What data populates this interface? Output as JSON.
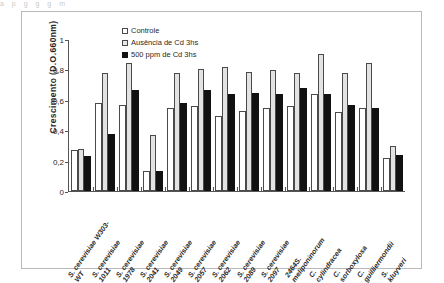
{
  "figure": {
    "ghost_text": "a      p          g  g                                                g            m",
    "background": "#ffffff",
    "frame_color": "#b9b9b9"
  },
  "axes": {
    "y_title": "Crescimento (D.O.660nm)",
    "y_ticks": [
      "0",
      "0,2",
      "0,4",
      "0,6",
      "0,8",
      "1"
    ],
    "y_min": 0,
    "y_max": 1,
    "x_title": ""
  },
  "legend": {
    "position": "top-left-inside",
    "items": [
      {
        "label": "Controle",
        "color": "#ffffff",
        "series_key": "s0"
      },
      {
        "label": "Ausência de Cd 3hs",
        "color": "#e3e3e3",
        "series_key": "s1"
      },
      {
        "label": "500 ppm de Cd 3hs",
        "color": "#111111",
        "series_key": "s2"
      }
    ]
  },
  "chart_data": {
    "type": "bar",
    "title": "",
    "xlabel": "",
    "ylabel": "Crescimento (D.O.660nm)",
    "ylim": [
      0,
      1
    ],
    "yticks": [
      0,
      0.2,
      0.4,
      0.6,
      0.8,
      1
    ],
    "grid": false,
    "legend_position": "upper left",
    "decimal_separator": ",",
    "categories": [
      "S. cerevisiae W303-WT",
      "S. cerevisiae 1011",
      "S. cerevisiae 1978",
      "S. cerevisiae 2041",
      "S. cerevisiae 2049",
      "S. cerevisiae 2057",
      "S. cerevisiae 2062",
      "S. cerevisiae 2089",
      "S. cerevisiae 2097",
      "S. meliponinorum 2464",
      "C. cylindracea",
      "C. sorboxylosa",
      "C. guilliermondii",
      "S. kluyveri"
    ],
    "category_lines": [
      [
        "S. cerevisiae W303-",
        "WT"
      ],
      [
        "S. cerevisiae",
        "1011"
      ],
      [
        "S. cerevisiae",
        "1978"
      ],
      [
        "S. cerevisiae",
        "2041"
      ],
      [
        "S. cerevisiae",
        "2049"
      ],
      [
        "S. cerevisiae",
        "2057"
      ],
      [
        "S. cerevisiae",
        "2062"
      ],
      [
        "S. cerevisiae",
        "2089"
      ],
      [
        "S. cerevisiae",
        "2097"
      ],
      [
        "2464S.",
        "meliponinorum"
      ],
      [
        "C.",
        "cylindracea"
      ],
      [
        "C.",
        "sorboxylosa"
      ],
      [
        "C.",
        "guilliermondii"
      ],
      [
        "S.",
        "kluyveri"
      ]
    ],
    "series": [
      {
        "name": "Controle",
        "color": "#ffffff",
        "values": [
          0.27,
          0.58,
          0.57,
          0.13,
          0.55,
          0.56,
          0.5,
          0.53,
          0.55,
          0.56,
          0.64,
          0.52,
          0.55,
          0.22
        ]
      },
      {
        "name": "Ausência de Cd 3hs",
        "color": "#e3e3e3",
        "values": [
          0.28,
          0.78,
          0.85,
          0.37,
          0.78,
          0.81,
          0.82,
          0.79,
          0.8,
          0.78,
          0.91,
          0.78,
          0.85,
          0.3
        ]
      },
      {
        "name": "500 ppm de Cd 3hs",
        "color": "#111111",
        "values": [
          0.23,
          0.38,
          0.67,
          0.13,
          0.58,
          0.67,
          0.64,
          0.65,
          0.64,
          0.68,
          0.64,
          0.57,
          0.55,
          0.24
        ]
      }
    ]
  }
}
